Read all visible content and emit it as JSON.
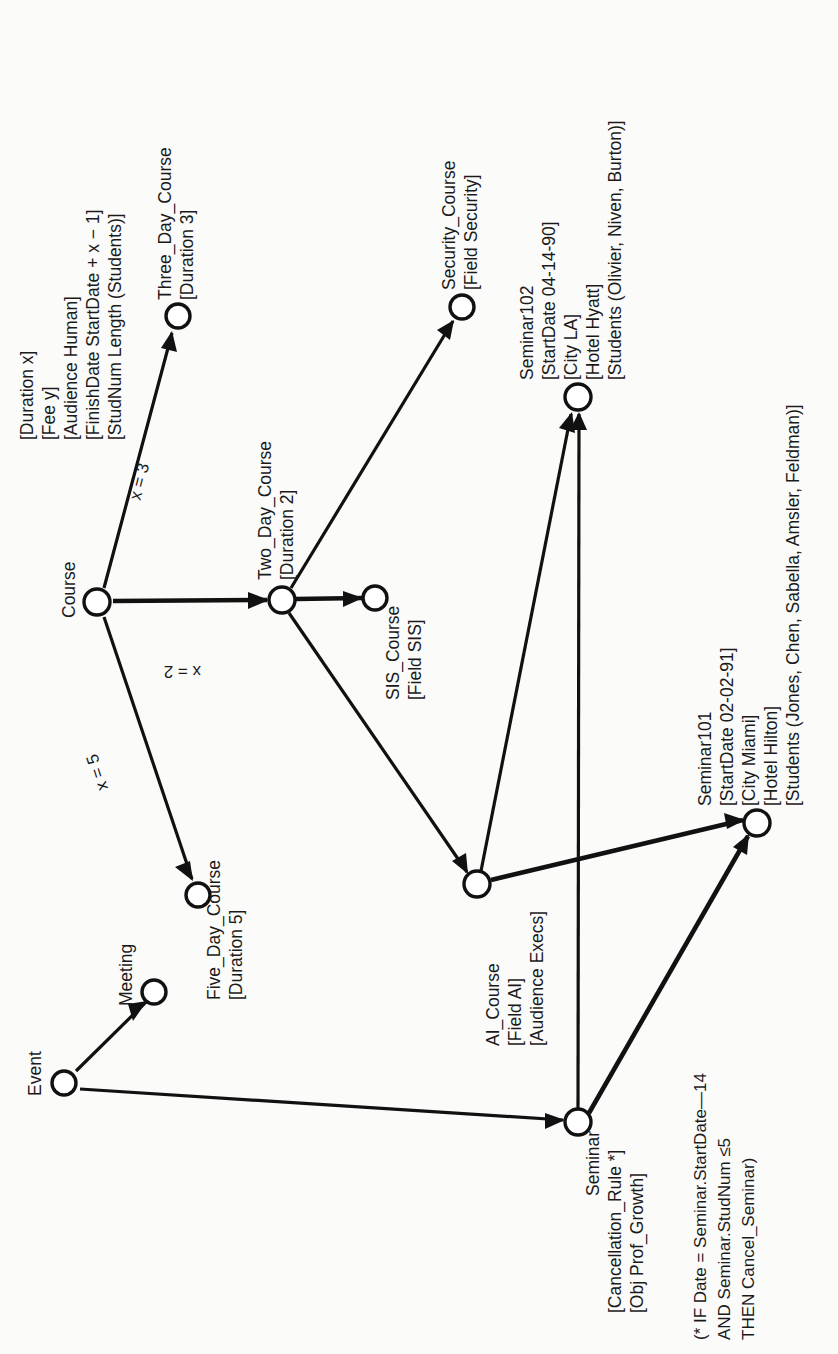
{
  "diagram": {
    "orientation": "rotated-90-ccw",
    "nodes": [
      {
        "id": "event",
        "label": "Event",
        "attributes": [],
        "x": 64,
        "y": 1083,
        "label_anchor": "above-left"
      },
      {
        "id": "meeting",
        "label": "Meeting",
        "attributes": [],
        "x": 154,
        "y": 992,
        "label_anchor": "above-left"
      },
      {
        "id": "course",
        "label": "Course",
        "attributes": [
          "[Duration x]",
          "[Fee y]",
          "[Audience Human]",
          "[FinishDate StartDate + x − 1]",
          "[StudNum Length (Students)]"
        ],
        "x": 97,
        "y": 602,
        "label_anchor": "above-left"
      },
      {
        "id": "five_day_course",
        "label": "Five_Day_Course",
        "attributes": [
          "[Duration 5]"
        ],
        "x": 198,
        "y": 895,
        "label_anchor": "below-right"
      },
      {
        "id": "three_day_course",
        "label": "Three_Day_Course",
        "attributes": [
          "[Duration 3]"
        ],
        "x": 178,
        "y": 316,
        "label_anchor": "above-right"
      },
      {
        "id": "two_day_course",
        "label": "Two_Day_Course",
        "attributes": [
          "[Duration 2]"
        ],
        "x": 282,
        "y": 600,
        "label_anchor": "above-right"
      },
      {
        "id": "sis_course",
        "label": "SIS_Course",
        "attributes": [
          "[Field SIS]"
        ],
        "x": 375,
        "y": 598,
        "label_anchor": "below-right"
      },
      {
        "id": "security_course",
        "label": "Security_Course",
        "attributes": [
          "[Field Security]"
        ],
        "x": 462,
        "y": 307,
        "label_anchor": "above-right"
      },
      {
        "id": "ai_course",
        "label": "AI_Course",
        "attributes": [
          "[Field AI]",
          "[Audience Execs]"
        ],
        "x": 477,
        "y": 884,
        "label_anchor": "below-right"
      },
      {
        "id": "seminar",
        "label": "Seminar",
        "attributes": [
          "[Cancellation_Rule *]",
          "[Obj Prof_Growth]"
        ],
        "x": 578,
        "y": 1122,
        "label_anchor": "below-right"
      },
      {
        "id": "seminar101",
        "label": "Seminar101",
        "attributes": [
          "[StartDate 02-02-91]",
          "[City Miami]",
          "[Hotel Hilton]",
          "[Students (Jones, Chen, Sabella, Amsler, Feldman)]"
        ],
        "x": 757,
        "y": 823,
        "label_anchor": "above-right"
      },
      {
        "id": "seminar102",
        "label": "Seminar102",
        "attributes": [
          "[StartDate 04-14-90]",
          "[City LA]",
          "[Hotel Hyatt]",
          "[Students (Olivier, Niven, Burton)]"
        ],
        "x": 578,
        "y": 397,
        "label_anchor": "above-right"
      }
    ],
    "edges": [
      {
        "from": "event",
        "to": "meeting",
        "label": ""
      },
      {
        "from": "event",
        "to": "seminar",
        "label": ""
      },
      {
        "from": "course",
        "to": "three_day_course",
        "label": "x = 3"
      },
      {
        "from": "course",
        "to": "two_day_course",
        "label": "x = 2"
      },
      {
        "from": "course",
        "to": "five_day_course",
        "label": "x = 5"
      },
      {
        "from": "two_day_course",
        "to": "sis_course",
        "label": ""
      },
      {
        "from": "two_day_course",
        "to": "security_course",
        "label": ""
      },
      {
        "from": "two_day_course",
        "to": "ai_course",
        "label": ""
      },
      {
        "from": "ai_course",
        "to": "seminar102",
        "label": ""
      },
      {
        "from": "ai_course",
        "to": "seminar101",
        "label": ""
      },
      {
        "from": "seminar",
        "to": "seminar102",
        "label": ""
      },
      {
        "from": "seminar",
        "to": "seminar101",
        "label": ""
      }
    ],
    "edge_labels": [
      {
        "id": "x3",
        "text": "x = 3",
        "x": 140,
        "y": 470
      },
      {
        "id": "x2",
        "text": "x = 2",
        "x": 196,
        "y": 640
      },
      {
        "id": "x5",
        "text": "x = 5",
        "x": 105,
        "y": 744
      }
    ],
    "footnote": {
      "id": "cancellation-rule-note",
      "lines": [
        "(* IF Date = Seminar.StartDate—14",
        "AND Seminar.StudNum ≤5",
        "THEN Cancel_Seminar)"
      ]
    },
    "colors": {
      "ink": "#111111",
      "paper": "#fbfbfa",
      "node_fill": "#ffffff"
    }
  }
}
